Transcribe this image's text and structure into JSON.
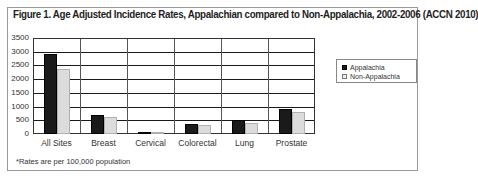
{
  "figure": {
    "title": "Figure 1. Age Adjusted Incidence Rates, Appalachian compared to Non-Appalachia, 2002-2006 (ACCN 2010)",
    "footnote": "*Rates are per 100,000 population"
  },
  "legend": [
    {
      "label": "Appalachia",
      "color": "#1a1a1a"
    },
    {
      "label": "Non-Appalachia",
      "color": "#dcdcdc"
    }
  ],
  "yticks": [
    "3500",
    "3000",
    "2500",
    "2000",
    "1500",
    "1000",
    "500",
    "0"
  ],
  "chart_data": {
    "type": "bar",
    "title": "Figure 1. Age Adjusted Incidence Rates, Appalachian compared to Non-Appalachia, 2002-2006 (ACCN 2010)",
    "xlabel": "",
    "ylabel": "",
    "categories": [
      "All Sites",
      "Breast",
      "Cervical",
      "Colorectal",
      "Lung",
      "Prostate"
    ],
    "series": [
      {
        "name": "Appalachia",
        "color": "#1a1a1a",
        "values": [
          2900,
          690,
          60,
          365,
          495,
          895
        ]
      },
      {
        "name": "Non-Appalachia",
        "color": "#dcdcdc",
        "values": [
          2370,
          620,
          55,
          330,
          400,
          800
        ]
      }
    ],
    "ylim": [
      0,
      3500
    ],
    "yticks": [
      0,
      500,
      1000,
      1500,
      2000,
      2500,
      3000,
      3500
    ],
    "grid": true,
    "legend_position": "right",
    "annotations": [
      "*Rates are per 100,000 population"
    ]
  }
}
